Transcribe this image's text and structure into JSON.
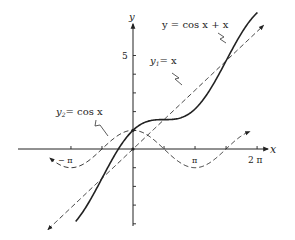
{
  "chart_data": {
    "type": "line",
    "title": "",
    "xlabel": "x",
    "ylabel": "y",
    "xlim": [
      -4.5,
      7.2
    ],
    "ylim": [
      -4.6,
      7.0
    ],
    "grid": false,
    "x_ticks": [
      {
        "value": -3.14159,
        "label": "−π"
      },
      {
        "value": -1.5708,
        "label": ""
      },
      {
        "value": 1.5708,
        "label": ""
      },
      {
        "value": 3.14159,
        "label": "π"
      },
      {
        "value": 4.7124,
        "label": ""
      },
      {
        "value": 6.28318,
        "label": "2π"
      }
    ],
    "y_ticks": [
      {
        "value": 5,
        "label": "5"
      },
      {
        "value": 4,
        "label": ""
      },
      {
        "value": 3,
        "label": ""
      },
      {
        "value": 2,
        "label": ""
      },
      {
        "value": 1,
        "label": ""
      },
      {
        "value": -1,
        "label": ""
      },
      {
        "value": -2,
        "label": ""
      },
      {
        "value": -3,
        "label": ""
      },
      {
        "value": -4,
        "label": ""
      }
    ],
    "series": [
      {
        "name": "y = cos x + x",
        "function": "cos(x)+x",
        "style": "solid",
        "x_range": [
          -2.9,
          6.3
        ]
      },
      {
        "name": "y1 = x",
        "function": "x",
        "style": "dashed",
        "x_range": [
          -4.3,
          6.6
        ],
        "arrows": "both"
      },
      {
        "name": "y2 = cos x",
        "function": "cos(x)",
        "style": "dashed",
        "x_range": [
          -4.2,
          5.9
        ],
        "arrows": "both"
      }
    ],
    "annotations": [
      {
        "text": "y = cos x + x",
        "target": "solid curve"
      },
      {
        "text": "y₁ = x",
        "target": "dashed line"
      },
      {
        "text": "y₂ = cos x",
        "target": "dashed cosine"
      }
    ]
  },
  "labels": {
    "x_axis": "x",
    "y_axis": "y",
    "tick_neg_pi": "− π",
    "tick_pi": "π",
    "tick_2pi": "2 π",
    "tick_5": "5",
    "sum_curve": "y = cos x + x",
    "y1_sym": "y",
    "y1_sub": "1",
    "y1_rest": "= x",
    "y2_sym": "y",
    "y2_sub": "2",
    "y2_rest": "= cos x"
  }
}
